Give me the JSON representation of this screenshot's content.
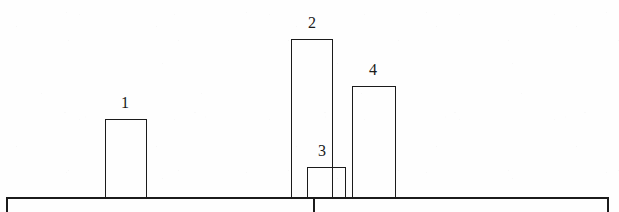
{
  "figure": {
    "width": 619,
    "height": 212,
    "background_color": "#fefefe",
    "ink_color": "#1b1b1b"
  },
  "chart_data": {
    "type": "bar",
    "title": "",
    "subtitle": "",
    "xlabel": "",
    "ylabel": "",
    "grid": false,
    "legend": null,
    "axis": {
      "baseline_y": 197,
      "x_start": 6,
      "x_end": 609,
      "end_caps": true,
      "ticks_below_baseline": [
        313
      ]
    },
    "ylim": [
      0,
      170
    ],
    "categories": [
      "1",
      "2",
      "3",
      "4"
    ],
    "values": [
      78,
      158,
      30,
      111
    ],
    "data_labels": [
      "1",
      "2",
      "3",
      "4"
    ],
    "bars": [
      {
        "label": "1",
        "value": 78,
        "left": 105,
        "right": 147,
        "width": 42,
        "top": 119,
        "baseline": 197,
        "height": 78,
        "label_x": 125,
        "label_y": 95
      },
      {
        "label": "2",
        "value": 158,
        "left": 291,
        "right": 333,
        "width": 42,
        "top": 39,
        "baseline": 197,
        "height": 158,
        "label_x": 312,
        "label_y": 15
      },
      {
        "label": "3",
        "value": 30,
        "left": 307,
        "right": 346,
        "width": 39,
        "top": 167,
        "baseline": 197,
        "height": 30,
        "label_x": 322,
        "label_y": 143
      },
      {
        "label": "4",
        "value": 111,
        "left": 352,
        "right": 396,
        "width": 44,
        "top": 86,
        "baseline": 197,
        "height": 111,
        "label_x": 373,
        "label_y": 62
      }
    ]
  }
}
